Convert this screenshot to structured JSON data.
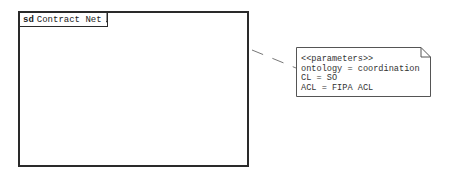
{
  "frame": {
    "keyword": "sd",
    "name": "Contract Net"
  },
  "note": {
    "stereotype": "<<parameters>>",
    "lines": [
      "ontology = coordination",
      "CL = SO",
      "ACL = FIPA ACL"
    ]
  },
  "colors": {
    "stroke": "#2a2a2a",
    "text": "#333333",
    "connector": "#777777"
  }
}
